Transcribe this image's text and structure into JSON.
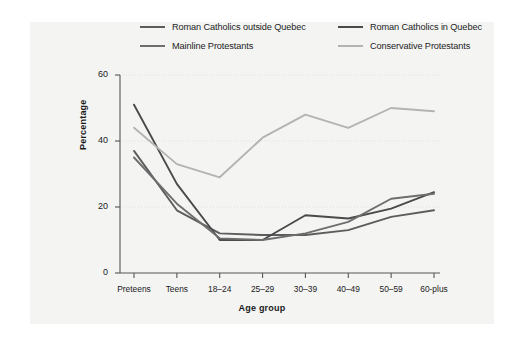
{
  "chart_data": {
    "type": "line",
    "title": "",
    "subtitle": "",
    "xlabel": "Age group",
    "ylabel": "Percentage",
    "categories": [
      "Preteens",
      "Teens",
      "18–24",
      "25–29",
      "30–39",
      "40–49",
      "50–59",
      "60-plus"
    ],
    "ylim": [
      0,
      60
    ],
    "yticks": [
      0,
      20,
      40,
      60
    ],
    "ytick_labels": [
      "0",
      "20",
      "40",
      "60"
    ],
    "grid": "horizontal-dotted",
    "legend_position": "top",
    "series": [
      {
        "name": "Roman Catholics outside Quebec",
        "color": "#5c5c5c",
        "values": [
          37,
          19,
          12,
          11.5,
          11.5,
          13,
          17,
          19
        ]
      },
      {
        "name": "Roman Catholics in Quebec",
        "color": "#4a4a4a",
        "values": [
          51,
          27,
          10,
          10,
          17.5,
          16.5,
          19.5,
          24.5
        ]
      },
      {
        "name": "Mainline Protestants",
        "color": "#6e6e6e",
        "values": [
          35,
          21,
          10.5,
          10,
          12,
          15.5,
          22.5,
          24
        ]
      },
      {
        "name": "Conservative Protestants",
        "color": "#b3b3b3",
        "values": [
          44,
          33,
          29,
          41,
          48,
          44,
          50,
          49
        ]
      }
    ]
  },
  "legend": {
    "items": [
      {
        "label": "Roman Catholics outside Quebec",
        "color": "#5c5c5c"
      },
      {
        "label": "Roman Catholics in Quebec",
        "color": "#4a4a4a"
      },
      {
        "label": "Mainline Protestants",
        "color": "#6e6e6e"
      },
      {
        "label": "Conservative Protestants",
        "color": "#b3b3b3"
      }
    ]
  },
  "axes": {
    "y_title": "Percentage",
    "x_title": "Age group",
    "y_ticks": [
      "0",
      "20",
      "40",
      "60"
    ],
    "x_ticks": [
      "Preteens",
      "Teens",
      "18–24",
      "25–29",
      "30–39",
      "40–49",
      "50–59",
      "60-plus"
    ]
  },
  "colors": {
    "page_background": "#ffffff",
    "panel_background": "#f4f4f3",
    "axis": "#555555",
    "grid": "#e3dede",
    "text": "#1a1a1a"
  }
}
